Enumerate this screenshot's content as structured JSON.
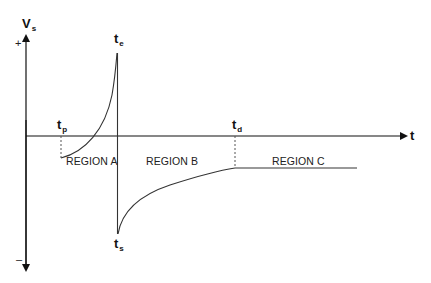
{
  "diagram": {
    "type": "waveform",
    "axes": {
      "y_label": {
        "main": "V",
        "sub": "s"
      },
      "x_label": "t",
      "y_positive": "+",
      "y_negative": "–"
    },
    "time_markers": [
      {
        "main": "t",
        "sub": "p"
      },
      {
        "main": "t",
        "sub": "e"
      },
      {
        "main": "t",
        "sub": "s"
      },
      {
        "main": "t",
        "sub": "d"
      }
    ],
    "regions": [
      {
        "label": "REGION A"
      },
      {
        "label": "REGION B"
      },
      {
        "label": "REGION C"
      }
    ],
    "colors": {
      "axis": "#111111",
      "curve": "#333333",
      "dashed": "#555555",
      "region_c_line": "#777777"
    }
  }
}
